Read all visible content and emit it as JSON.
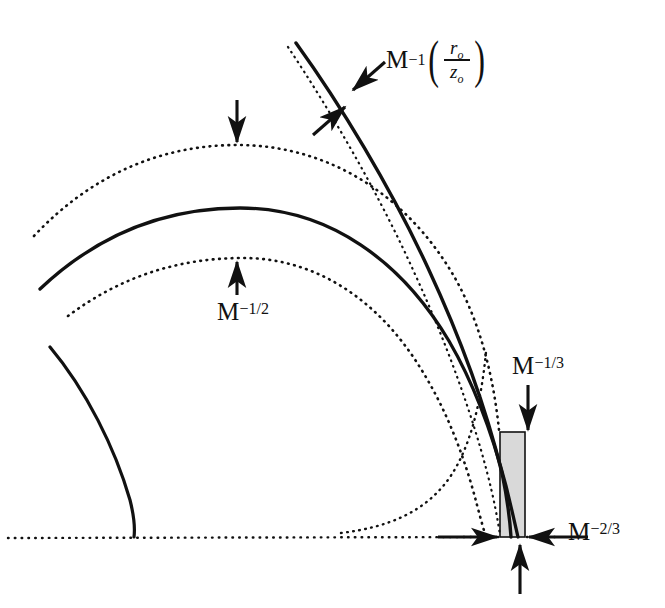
{
  "figure": {
    "background": "#ffffff",
    "ink_color": "#111111",
    "shaded_box_fill": "#d9d9d9",
    "width": 665,
    "height": 608
  },
  "labels": {
    "outer_shell": {
      "name": "M-inverse-r0-over-z0",
      "base": "M",
      "exponent": "−1",
      "fraction_numerator": "r",
      "fraction_numerator_sub": "o",
      "fraction_denominator": "z",
      "fraction_denominator_sub": "o",
      "text": "M⁻¹(rₒ/zₒ)"
    },
    "shell_thickness": {
      "name": "M-inverse-one-half",
      "base": "M",
      "exponent": "−1/2",
      "text": "M⁻¹ᐟ²"
    },
    "head_height": {
      "name": "M-inverse-one-third",
      "base": "M",
      "exponent": "−1/3",
      "text": "M⁻¹ᐟ³"
    },
    "head_width": {
      "name": "M-inverse-two-thirds",
      "base": "M",
      "exponent": "−2/3",
      "text": "M⁻²ᐟ³"
    }
  },
  "curves": [
    {
      "name": "outer-solid-shock",
      "style": "solid",
      "role": "outer bow shock front"
    },
    {
      "name": "outer-dotted-shell",
      "style": "dotted",
      "role": "outer dotted shell boundary"
    },
    {
      "name": "middle-solid-shock",
      "style": "solid",
      "role": "middle solid contact surface"
    },
    {
      "name": "inner-dotted-shell",
      "style": "dotted",
      "role": "inner dotted shell boundary"
    },
    {
      "name": "inner-cavity-arc",
      "style": "solid",
      "role": "small inner cavity arc"
    },
    {
      "name": "axis-dotted-line",
      "style": "dotted",
      "role": "horizontal symmetry axis"
    },
    {
      "name": "throat-dotted-curve",
      "style": "dotted",
      "role": "dotted curve entering the head region"
    }
  ],
  "annotations": [
    {
      "name": "arrow-outer-shell-upper",
      "direction": "down-left",
      "points_to": "outer-solid-shock"
    },
    {
      "name": "arrow-outer-shell-lower",
      "direction": "up-right",
      "points_to": "outer-dotted-shell"
    },
    {
      "name": "arrow-shell-top-down",
      "direction": "down",
      "points_to": "outer-dotted-shell"
    },
    {
      "name": "arrow-shell-bottom-up",
      "direction": "up",
      "points_to": "inner-dotted-shell"
    },
    {
      "name": "arrow-head-height-down",
      "direction": "down",
      "points_to": "shaded-head-box-top"
    },
    {
      "name": "arrow-head-width-left",
      "direction": "right",
      "points_to": "shaded-head-box-left"
    },
    {
      "name": "arrow-head-width-right",
      "direction": "left",
      "points_to": "shaded-head-box-right"
    },
    {
      "name": "arrow-head-bottom-up",
      "direction": "up",
      "points_to": "shaded-head-box-bottom"
    }
  ],
  "shaded_box": {
    "name": "shaded-head-box",
    "x": 500,
    "y": 432,
    "width": 25,
    "height": 105,
    "fill": "#d9d9d9",
    "stroke": "#111111"
  }
}
